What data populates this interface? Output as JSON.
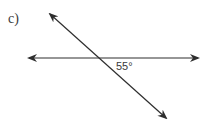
{
  "problem": {
    "label": "c)"
  },
  "diagram": {
    "angle_label": "55°",
    "line_color": "#2e2e2e",
    "horizontal_line": {
      "x1": 29,
      "y1": 58,
      "x2": 198,
      "y2": 58
    },
    "transversal_line": {
      "x1": 50,
      "y1": 14,
      "x2": 166,
      "y2": 118
    }
  }
}
